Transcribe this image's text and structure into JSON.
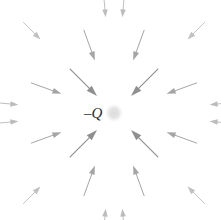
{
  "figure": {
    "name": "electric-field-negative-point-charge",
    "width": 221,
    "height": 220,
    "background_color": "#ffffff"
  },
  "charge": {
    "label": "–Q",
    "label_color": "#2b2b2b",
    "label_x": 84,
    "label_y": 106,
    "sign": "negative",
    "dot_color": "#e2e2e2",
    "dot_center_x": 114,
    "dot_center_y": 113,
    "dot_radius": 8
  },
  "field": {
    "direction": "inward",
    "arrow_color_inner": "#8f8f8f",
    "arrow_color_mid": "#a9a9a9",
    "arrow_color_outer": "#c4c4c4",
    "center_x": 114,
    "center_y": 113,
    "ring_count": 4,
    "arrow_count": 24
  },
  "chart_data": {
    "type": "scatter",
    "title": "",
    "xlabel": "",
    "ylabel": "",
    "annotations": [
      "–Q"
    ],
    "center": [
      114,
      113
    ],
    "rings": [
      {
        "name": "inner-diagonal",
        "radius_tail": 62,
        "radius_head": 24,
        "color": "#8f8f8f",
        "stroke": 1.15,
        "head_length": 11,
        "head_width": 7,
        "angles": [
          45,
          135,
          225,
          315
        ]
      },
      {
        "name": "mid-offaxis",
        "radius_tail": 88,
        "radius_head": 56,
        "color": "#a5a5a5",
        "stroke": 1.0,
        "head_length": 9,
        "head_width": 6,
        "angles": [
          20,
          70,
          110,
          160,
          200,
          250,
          290,
          340
        ]
      },
      {
        "name": "outer-diagonal",
        "radius_tail": 128,
        "radius_head": 104,
        "color": "#c0c0c0",
        "stroke": 0.95,
        "head_length": 8,
        "head_width": 5.5,
        "angles": [
          45,
          135,
          225,
          315
        ]
      },
      {
        "name": "outer-offaxis",
        "radius_tail": 118,
        "radius_head": 96,
        "color": "#bcbcbc",
        "stroke": 0.95,
        "head_length": 8,
        "head_width": 5.5,
        "angles": [
          5,
          85,
          95,
          175,
          185,
          265,
          275,
          355
        ]
      }
    ],
    "vectors": [
      {
        "angle": 45,
        "ring": "inner-diagonal",
        "tail": [
          58,
          57
        ],
        "head": [
          97,
          96
        ]
      },
      {
        "angle": 135,
        "ring": "inner-diagonal",
        "tail": [
          158,
          57
        ],
        "head": [
          131,
          96
        ]
      },
      {
        "angle": 225,
        "ring": "inner-diagonal",
        "tail": [
          58,
          169
        ],
        "head": [
          97,
          130
        ]
      },
      {
        "angle": 315,
        "ring": "inner-diagonal",
        "tail": [
          158,
          169
        ],
        "head": [
          131,
          130
        ]
      },
      {
        "angle": 70,
        "ring": "mid-offaxis",
        "tail": [
          82,
          28
        ],
        "head": [
          93,
          58
        ]
      },
      {
        "angle": 110,
        "ring": "mid-offaxis",
        "tail": [
          146,
          28
        ],
        "head": [
          135,
          58
        ]
      },
      {
        "angle": 20,
        "ring": "mid-offaxis",
        "tail": [
          26,
          82
        ],
        "head": [
          58,
          92
        ]
      },
      {
        "angle": 160,
        "ring": "mid-offaxis",
        "tail": [
          202,
          82
        ],
        "head": [
          170,
          92
        ]
      },
      {
        "angle": 200,
        "ring": "mid-offaxis",
        "tail": [
          26,
          144
        ],
        "head": [
          58,
          134
        ]
      },
      {
        "angle": 340,
        "ring": "mid-offaxis",
        "tail": [
          202,
          144
        ],
        "head": [
          170,
          134
        ]
      },
      {
        "angle": 250,
        "ring": "mid-offaxis",
        "tail": [
          82,
          198
        ],
        "head": [
          93,
          168
        ]
      },
      {
        "angle": 290,
        "ring": "mid-offaxis",
        "tail": [
          146,
          198
        ],
        "head": [
          135,
          168
        ]
      },
      {
        "angle": 45,
        "ring": "outer-diagonal",
        "tail": [
          9,
          9
        ],
        "head": [
          28,
          28
        ]
      },
      {
        "angle": 135,
        "ring": "outer-diagonal",
        "tail": [
          211,
          9
        ],
        "head": [
          194,
          28
        ]
      },
      {
        "angle": 225,
        "ring": "outer-diagonal",
        "tail": [
          9,
          212
        ],
        "head": [
          28,
          195
        ]
      },
      {
        "angle": 315,
        "ring": "outer-diagonal",
        "tail": [
          211,
          212
        ],
        "head": [
          194,
          195
        ]
      }
    ]
  }
}
